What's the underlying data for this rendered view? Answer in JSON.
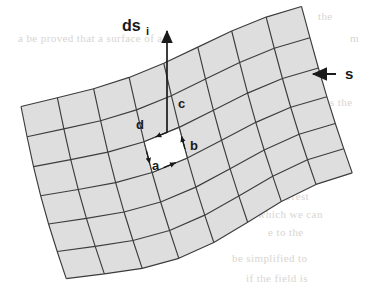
{
  "figure": {
    "type": "technical-diagram",
    "background_color": "#ffffff",
    "cell_fill_color": "#dedede",
    "highlight_cell_fill_color": "#ffffff",
    "grid_line_color": "#3c3c3c",
    "label_color": "#1a1a1a",
    "grid": {
      "columns": 8,
      "rows": 6,
      "highlight_cell": {
        "row": 2,
        "col": 3
      }
    },
    "labels": {
      "ds_base": "ds",
      "ds_subscript": "i",
      "surface": "s",
      "edge_a": "a",
      "edge_b": "b",
      "edge_c": "c",
      "edge_d": "d"
    },
    "arrows": {
      "normal_vector": "ds-i-normal-arrow",
      "surface_pointer": "s-pointer-arrow",
      "circuit_a": "edge-a-arrow",
      "circuit_b": "edge-b-arrow",
      "circuit_c": "edge-c-arrow",
      "circuit_d": "edge-d-arrow"
    },
    "bleed_through_text": [
      {
        "text": "the",
        "x": 318,
        "y": 10
      },
      {
        "text": "a  be  proved  that  a  surface  of  a",
        "x": 18,
        "y": 32
      },
      {
        "text": "m",
        "x": 350,
        "y": 32
      },
      {
        "text": "Con",
        "x": 300,
        "y": 74
      },
      {
        "text": "s the",
        "x": 330,
        "y": 96
      },
      {
        "text": "by a  circuit  of",
        "x": 175,
        "y": 118
      },
      {
        "text": "urface  is  then",
        "x": 185,
        "y": 136
      },
      {
        "text": "to the",
        "x": 300,
        "y": 158
      },
      {
        "text": "cases  of  interest",
        "x": 232,
        "y": 190
      },
      {
        "text": "in  which  we  can",
        "x": 245,
        "y": 208
      },
      {
        "text": "e  to  the",
        "x": 268,
        "y": 226
      },
      {
        "text": "be  simplified  to",
        "x": 232,
        "y": 252
      },
      {
        "text": "if  the  field  is",
        "x": 246,
        "y": 272
      }
    ]
  }
}
